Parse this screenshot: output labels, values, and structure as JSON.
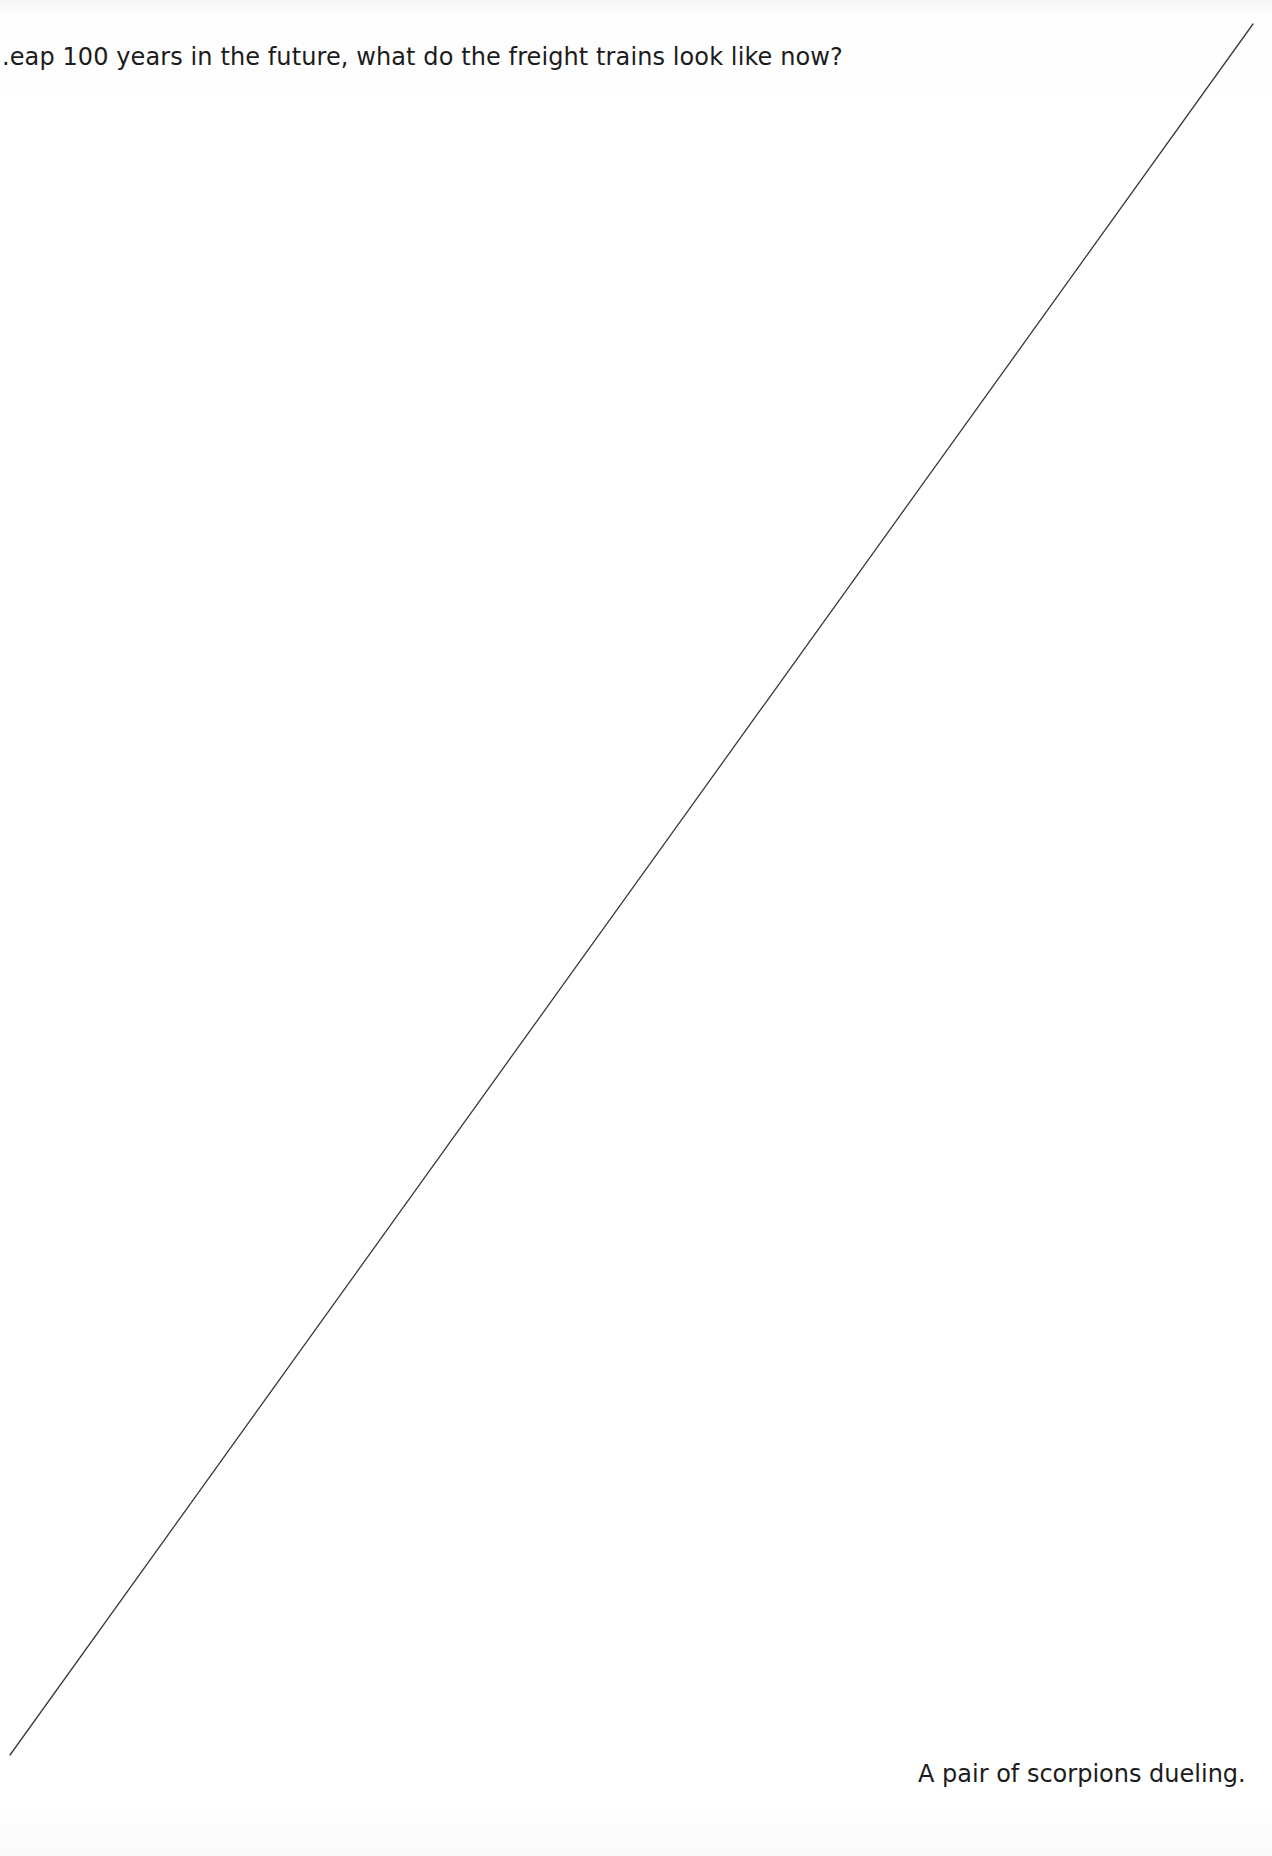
{
  "page": {
    "top_prompt": ".eap 100 years in the future, what do the freight trains look like now?",
    "bottom_prompt": "A pair of scorpions dueling.",
    "divider": {
      "x1": 1253,
      "y1": 24,
      "x2": 10,
      "y2": 1755,
      "color": "#3a3a3a"
    },
    "colors": {
      "background": "#ffffff",
      "text": "#1c1c1c"
    }
  }
}
